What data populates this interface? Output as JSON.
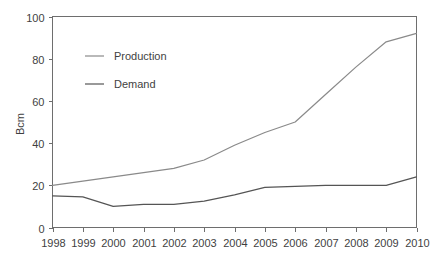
{
  "chart_data": {
    "type": "line",
    "title": "",
    "xlabel": "",
    "ylabel": "Bcm",
    "categories": [
      "1998",
      "1999",
      "2000",
      "2001",
      "2002",
      "2003",
      "2004",
      "2005",
      "2006",
      "2007",
      "2008",
      "2009",
      "2010"
    ],
    "x": [
      1998,
      1999,
      2000,
      2001,
      2002,
      2003,
      2004,
      2005,
      2006,
      2007,
      2008,
      2009,
      2010
    ],
    "xlim": [
      1998,
      2010
    ],
    "ylim": [
      0,
      100
    ],
    "yticks": [
      0,
      20,
      40,
      60,
      80,
      100
    ],
    "ytick_labels": [
      "0",
      "20",
      "40",
      "60",
      "80",
      "100"
    ],
    "grid": false,
    "legend_position": "upper-left-inside",
    "series": [
      {
        "name": "Production",
        "color": "#8a8a8a",
        "values": [
          20,
          22,
          24,
          26,
          28,
          32,
          39,
          45,
          50,
          63,
          76,
          88,
          92
        ]
      },
      {
        "name": "Demand",
        "color": "#555555",
        "values": [
          15,
          14.5,
          10,
          11,
          11,
          12.5,
          15.5,
          19,
          19.5,
          20,
          20,
          20,
          24
        ]
      }
    ]
  },
  "axes": {
    "y_axis_title": "Bcm"
  },
  "legend": {
    "items": [
      {
        "label": "Production"
      },
      {
        "label": "Demand"
      }
    ]
  },
  "colors": {
    "production": "#8a8a8a",
    "demand": "#555555",
    "frame": "#6e6e6e",
    "text": "#3f3f3f",
    "background": "#ffffff"
  }
}
